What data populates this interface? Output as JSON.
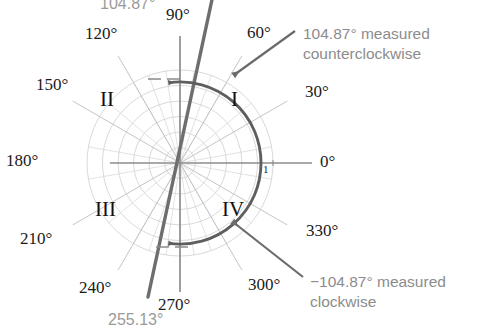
{
  "figure": {
    "type": "polar-angle-diagram",
    "radial_tick_label": "1",
    "center": {
      "x": 180,
      "y": 163
    },
    "outer_radius": 93
  },
  "axis_labels": [
    {
      "text": "0°",
      "angle": 0,
      "x": 320,
      "y": 153
    },
    {
      "text": "30°",
      "angle": 30,
      "x": 305,
      "y": 83
    },
    {
      "text": "60°",
      "angle": 60,
      "x": 247,
      "y": 24
    },
    {
      "text": "90°",
      "angle": 90,
      "x": 166,
      "y": 6
    },
    {
      "text": "120°",
      "angle": 120,
      "x": 85,
      "y": 25
    },
    {
      "text": "150°",
      "angle": 150,
      "x": 36,
      "y": 76
    },
    {
      "text": "180°",
      "angle": 180,
      "x": 6,
      "y": 152
    },
    {
      "text": "210°",
      "angle": 210,
      "x": 20,
      "y": 230
    },
    {
      "text": "240°",
      "angle": 240,
      "x": 79,
      "y": 279
    },
    {
      "text": "270°",
      "angle": 270,
      "x": 158,
      "y": 296
    },
    {
      "text": "300°",
      "angle": 300,
      "x": 248,
      "y": 276
    },
    {
      "text": "330°",
      "angle": 330,
      "x": 306,
      "y": 222
    }
  ],
  "quadrant_labels": [
    {
      "text": "I",
      "x": 231,
      "y": 89
    },
    {
      "text": "II",
      "x": 100,
      "y": 89
    },
    {
      "text": "III",
      "x": 95,
      "y": 199
    },
    {
      "text": "IV",
      "x": 222,
      "y": 199
    }
  ],
  "terminal_ray": {
    "positive_angle_label": "104.87°",
    "positive_angle_label_x": 100,
    "positive_angle_label_y": -4,
    "negative_angle_label": "255.13°",
    "negative_angle_label_x": 108,
    "negative_angle_label_y": 312,
    "angle_deg": 104.87
  },
  "annotations": [
    {
      "id": "counterclockwise",
      "line1": "104.87° measured",
      "line2": "counterclockwise",
      "x": 303,
      "y": 24
    },
    {
      "id": "clockwise",
      "line1": "−104.87° measured",
      "line2": "clockwise",
      "x": 310,
      "y": 272
    }
  ],
  "colors": {
    "grid": "#c9c9c9",
    "grid_light": "#dcdcdc",
    "axis": "#8a8a8a",
    "ray": "#6e6e6e",
    "arc": "#5e5e5e",
    "label": "#1a1a1a",
    "annotation": "#8c8c8c",
    "gray_label": "#9a9a9a",
    "leader": "#6e6e6e"
  }
}
